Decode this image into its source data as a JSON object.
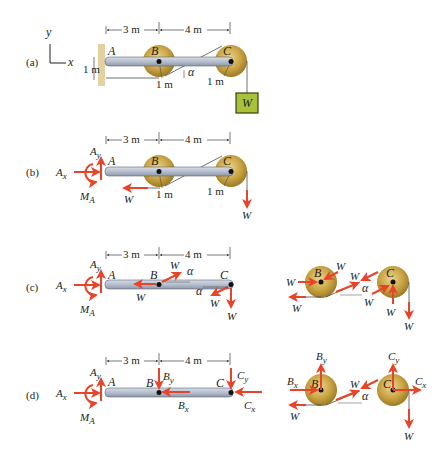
{
  "colors": {
    "force_arrow": "#e8442a",
    "beam_fill": "#b9c1cf",
    "beam_stroke": "#5d6677",
    "pulley_outer": "#c8a23e",
    "pulley_inner": "#e0c46c",
    "wall": "#e3d1a2",
    "weight_fill": "#a8c23a",
    "weight_stroke": "#3a4010",
    "rope": "#4b4b4b",
    "text": "#231f20"
  },
  "axes": {
    "y_label": "y",
    "x_label": "x"
  },
  "dimensions": {
    "ab": "3 m",
    "bc": "4 m",
    "radius_b": "1 m",
    "radius_c": "1 m",
    "wall_offset": "1 m"
  },
  "points": {
    "a": "A",
    "b": "B",
    "c": "C"
  },
  "angle": "α",
  "weight_label": "W",
  "panels": [
    {
      "id": "a",
      "label": "(a)"
    },
    {
      "id": "b",
      "label": "(b)"
    },
    {
      "id": "c",
      "label": "(c)"
    },
    {
      "id": "d",
      "label": "(d)"
    }
  ],
  "forces": {
    "ax": "A",
    "ax_sub": "x",
    "ay": "A",
    "ay_sub": "y",
    "ma": "M",
    "ma_sub": "A",
    "w": "W",
    "bx": "B",
    "bx_sub": "x",
    "by": "B",
    "by_sub": "y",
    "cx": "C",
    "cx_sub": "x",
    "cy": "C",
    "cy_sub": "y"
  }
}
